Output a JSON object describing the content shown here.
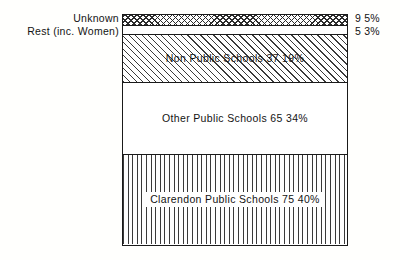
{
  "chart_data": {
    "type": "bar",
    "orientation": "vertical-stacked",
    "title": "",
    "subtitle": "",
    "xlabel": "",
    "ylabel": "",
    "grid": false,
    "legend_position": "inline",
    "total": 191,
    "categories": [
      "Unknown",
      "Rest (inc. Women)",
      "Non Public Schools",
      "Other Public Schools",
      "Clarendon Public Schools"
    ],
    "values": [
      9,
      5,
      37,
      65,
      75
    ],
    "percentages": [
      5,
      3,
      19,
      34,
      40
    ],
    "series": [
      {
        "name": "Distribution",
        "values": [
          9,
          5,
          37,
          65,
          75
        ]
      }
    ],
    "annotations": [
      "Unknown 9 5%",
      "Rest (inc. Women) 5 3%",
      "Non Public Schools 37 19%",
      "Other Public Schools 65 34%",
      "Clarendon Public Schools 75 40%"
    ]
  },
  "segments": [
    {
      "id": "unknown",
      "label": "Unknown",
      "count": "9",
      "percent": "5%",
      "pattern": "crosshatch",
      "label_position": "left-outside"
    },
    {
      "id": "rest",
      "label": "Rest (inc. Women)",
      "count": "5",
      "percent": "3%",
      "pattern": "plain",
      "label_position": "left-outside"
    },
    {
      "id": "non_public_schools",
      "label": "Non Public Schools 37 19%",
      "count": "37",
      "percent": "19%",
      "pattern": "diagonal",
      "label_position": "inside"
    },
    {
      "id": "other_public_schools",
      "label": "Other Public Schools 65 34%",
      "count": "65",
      "percent": "34%",
      "pattern": "plain",
      "label_position": "inside"
    },
    {
      "id": "clarendon_public_schools",
      "label": "Clarendon Public Schools 75 40%",
      "count": "75",
      "percent": "40%",
      "pattern": "vertical",
      "label_position": "inside"
    }
  ],
  "colors": {
    "page_background": "#fffffd",
    "bar_fill": "#ffffff",
    "outline": "#1a1a1a",
    "hatch": "#333333",
    "text": "#131313"
  }
}
